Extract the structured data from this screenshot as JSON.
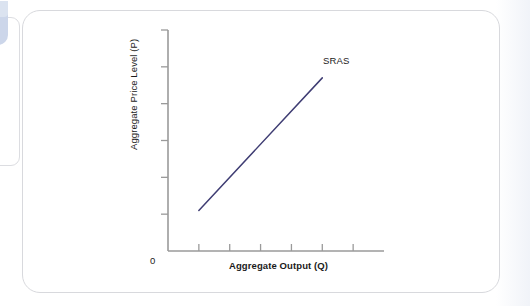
{
  "figure": {
    "background_color": "#ffffff",
    "card_border_color": "#d8d9dd",
    "left_card_swatch_color": "#ccd6ea"
  },
  "chart_data": {
    "type": "line",
    "title": "",
    "xlabel": "Aggregate Output (Q)",
    "ylabel": "Aggregate Price Level (P)",
    "origin_label": "0",
    "grid": false,
    "legend_position": "inline-end-of-line",
    "axis_color": "#9a9a9a",
    "series": [
      {
        "name": "SRAS",
        "color": "#3f3d73",
        "label": "SRAS",
        "x": [
          1.0,
          5.0
        ],
        "y": [
          1.1,
          4.7
        ]
      }
    ],
    "xlim": [
      0,
      7
    ],
    "ylim": [
      0,
      6
    ],
    "x_ticks": [
      1,
      2,
      3,
      4,
      5,
      6
    ],
    "x_tick_labels": [
      "",
      "",
      "",
      "",
      "",
      ""
    ],
    "y_ticks": [
      1,
      2,
      3,
      4,
      5,
      6
    ],
    "y_tick_labels": [
      "",
      "",
      "",
      "",
      "",
      ""
    ],
    "annotations": [
      {
        "text": "SRAS",
        "x": 5.15,
        "y": 5.15
      }
    ]
  }
}
